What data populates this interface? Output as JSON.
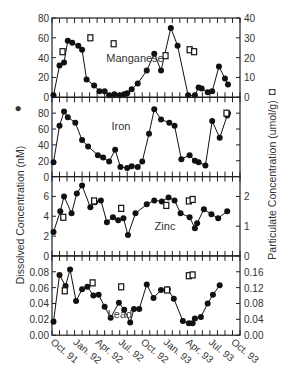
{
  "chart_data": {
    "type": "line",
    "layout": "4 stacked panels sharing x-axis, dual y-axes",
    "ylabel_left": "Dissolved Concentration (nM)",
    "ylabel_left_marker": "filled circle",
    "ylabel_right": "Particulate Concentration (umol/g)",
    "ylabel_right_marker": "open square",
    "x_tick_labels": [
      "Oct. 91",
      "Jan. 92",
      "Apr. 92",
      "Jul. 92",
      "Oct. 92",
      "Jan. 93",
      "Apr. 93",
      "Jul. 93",
      "Oct. 93"
    ],
    "x_range_months": [
      0,
      25
    ],
    "grid": false,
    "panels": [
      {
        "name": "Manganese",
        "left_ylim": [
          0,
          80
        ],
        "left_ticks": [
          "0",
          "20",
          "40",
          "60",
          "80"
        ],
        "right_ylim": [
          0,
          40
        ],
        "right_ticks": [
          "0",
          "10",
          "20",
          "30",
          "40"
        ],
        "dissolved": [
          [
            0.2,
            2
          ],
          [
            1.0,
            32
          ],
          [
            1.6,
            35
          ],
          [
            2.1,
            57
          ],
          [
            2.7,
            55
          ],
          [
            3.5,
            52
          ],
          [
            4.0,
            48
          ],
          [
            4.6,
            18
          ],
          [
            5.6,
            12
          ],
          [
            6.3,
            6
          ],
          [
            7.0,
            6
          ],
          [
            7.6,
            2
          ],
          [
            8.3,
            3
          ],
          [
            9.0,
            2
          ],
          [
            9.6,
            3
          ],
          [
            10.0,
            4
          ],
          [
            10.6,
            8
          ],
          [
            11.4,
            14
          ],
          [
            12.6,
            27
          ],
          [
            13.6,
            44
          ],
          [
            14.5,
            27
          ],
          [
            15.8,
            70
          ],
          [
            16.7,
            52
          ],
          [
            18.1,
            2
          ],
          [
            19.0,
            2
          ],
          [
            19.5,
            10
          ],
          [
            19.9,
            9
          ],
          [
            20.7,
            5
          ],
          [
            21.3,
            6
          ],
          [
            22.2,
            31
          ],
          [
            23.0,
            19
          ],
          [
            23.4,
            13
          ]
        ],
        "particulate": [
          [
            1.4,
            23
          ],
          [
            5.1,
            30
          ],
          [
            8.2,
            27
          ],
          [
            15.1,
            21
          ],
          [
            18.3,
            24
          ],
          [
            18.9,
            23
          ]
        ]
      },
      {
        "name": "Iron",
        "left_ylim": [
          0,
          100
        ],
        "left_ticks": [
          "0",
          "20",
          "40",
          "60",
          "80"
        ],
        "right_ylim": null,
        "right_ticks": [],
        "dissolved": [
          [
            0.2,
            18
          ],
          [
            1.0,
            64
          ],
          [
            1.6,
            82
          ],
          [
            2.1,
            75
          ],
          [
            3.1,
            68
          ],
          [
            4.0,
            46
          ],
          [
            4.8,
            38
          ],
          [
            6.1,
            27
          ],
          [
            6.8,
            24
          ],
          [
            7.6,
            19
          ],
          [
            8.4,
            34
          ],
          [
            9.1,
            12
          ],
          [
            10.0,
            11
          ],
          [
            10.6,
            13
          ],
          [
            11.4,
            12
          ],
          [
            12.0,
            19
          ],
          [
            12.9,
            54
          ],
          [
            13.6,
            85
          ],
          [
            14.5,
            72
          ],
          [
            15.6,
            68
          ],
          [
            16.3,
            64
          ],
          [
            17.2,
            22
          ],
          [
            18.3,
            27
          ],
          [
            19.0,
            20
          ],
          [
            19.5,
            18
          ],
          [
            20.4,
            14
          ],
          [
            21.3,
            70
          ],
          [
            22.3,
            49
          ],
          [
            23.3,
            77
          ],
          [
            23.4,
            80
          ]
        ],
        "particulate": [
          [
            23.2,
            80
          ]
        ]
      },
      {
        "name": "Zinc",
        "left_ylim": [
          0,
          8
        ],
        "left_ticks": [
          "0",
          "2",
          "4",
          "6"
        ],
        "right_ylim": [
          0,
          2.67
        ],
        "right_ticks": [
          "0",
          "1",
          "2"
        ],
        "dissolved": [
          [
            0.2,
            2.4
          ],
          [
            1.1,
            4.5
          ],
          [
            1.6,
            6.0
          ],
          [
            2.6,
            4.3
          ],
          [
            3.3,
            6.3
          ],
          [
            4.0,
            7.1
          ],
          [
            5.1,
            4.9
          ],
          [
            5.7,
            5.4
          ],
          [
            6.5,
            5.6
          ],
          [
            7.3,
            3.4
          ],
          [
            8.1,
            3.9
          ],
          [
            8.8,
            3.6
          ],
          [
            9.5,
            3.8
          ],
          [
            10.1,
            2.1
          ],
          [
            11.1,
            4.3
          ],
          [
            12.6,
            5.2
          ],
          [
            13.6,
            5.6
          ],
          [
            14.6,
            5.5
          ],
          [
            15.5,
            5.9
          ],
          [
            16.3,
            5.6
          ],
          [
            17.1,
            4.3
          ],
          [
            18.3,
            3.9
          ],
          [
            19.0,
            2.8
          ],
          [
            19.3,
            3.3
          ],
          [
            20.2,
            4.7
          ],
          [
            21.2,
            4.2
          ],
          [
            22.1,
            3.8
          ],
          [
            23.3,
            4.5
          ]
        ],
        "particulate": [
          [
            1.5,
            1.3
          ],
          [
            5.6,
            1.85
          ],
          [
            9.2,
            1.6
          ],
          [
            15.2,
            1.7
          ],
          [
            18.2,
            1.85
          ],
          [
            18.7,
            1.9
          ]
        ]
      },
      {
        "name": "Lead",
        "left_ylim": [
          0,
          0.1
        ],
        "left_ticks": [
          "0.00",
          "0.02",
          "0.04",
          "0.06",
          "0.08"
        ],
        "right_ylim": [
          0,
          0.2
        ],
        "right_ticks": [
          "0.00",
          "0.04",
          "0.08",
          "0.12",
          "0.16"
        ],
        "dissolved": [
          [
            0.2,
            0.017
          ],
          [
            1.0,
            0.076
          ],
          [
            1.8,
            0.062
          ],
          [
            2.4,
            0.083
          ],
          [
            3.2,
            0.043
          ],
          [
            4.0,
            0.058
          ],
          [
            4.7,
            0.061
          ],
          [
            5.5,
            0.05
          ],
          [
            6.2,
            0.051
          ],
          [
            7.0,
            0.036
          ],
          [
            7.8,
            0.022
          ],
          [
            8.9,
            0.041
          ],
          [
            9.6,
            0.032
          ],
          [
            10.4,
            0.016
          ],
          [
            10.9,
            0.033
          ],
          [
            11.6,
            0.033
          ],
          [
            12.6,
            0.064
          ],
          [
            13.5,
            0.047
          ],
          [
            14.5,
            0.057
          ],
          [
            15.4,
            0.058
          ],
          [
            16.2,
            0.046
          ],
          [
            17.4,
            0.018
          ],
          [
            18.2,
            0.015
          ],
          [
            18.7,
            0.015
          ],
          [
            19.0,
            0.021
          ],
          [
            19.8,
            0.023
          ],
          [
            20.7,
            0.04
          ],
          [
            21.4,
            0.051
          ],
          [
            22.3,
            0.063
          ]
        ],
        "particulate": [
          [
            1.7,
            0.112
          ],
          [
            5.4,
            0.132
          ],
          [
            9.2,
            0.122
          ],
          [
            15.3,
            0.114
          ],
          [
            18.2,
            0.15
          ],
          [
            18.7,
            0.152
          ]
        ]
      }
    ]
  }
}
